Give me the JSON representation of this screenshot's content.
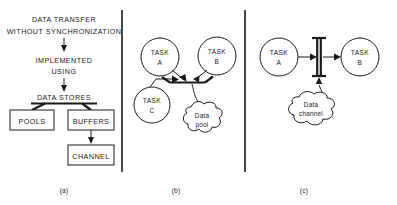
{
  "figure": {
    "width": 397,
    "height": 205,
    "background": "#ffffff",
    "ink_color": "#1a1a1a"
  },
  "panels": [
    {
      "id": "a",
      "label": "(a)",
      "caption_x": 64,
      "caption_y": 193,
      "kind": "flow-hierarchy"
    },
    {
      "id": "b",
      "label": "(b)",
      "caption_x": 176,
      "caption_y": 193,
      "kind": "pool-diagram"
    },
    {
      "id": "c",
      "label": "(c)",
      "caption_x": 304,
      "caption_y": 193,
      "kind": "channel-diagram"
    }
  ],
  "panel_a": {
    "heading_line1": "DATA TRANSFER",
    "heading_line2": "WITHOUT SYNCHRONIZATION",
    "connector_line1": "IMPLEMENTED",
    "connector_line2": "USING",
    "category": "DATA STORES",
    "boxes": [
      {
        "label": "POOLS",
        "x": 10,
        "y": 110,
        "w": 44,
        "h": 20
      },
      {
        "label": "BUFFERS",
        "x": 68,
        "y": 110,
        "w": 46,
        "h": 20
      },
      {
        "label": "CHANNEL",
        "x": 68,
        "y": 145,
        "w": 46,
        "h": 20
      }
    ]
  },
  "panel_b": {
    "tasks": [
      {
        "label_line1": "TASK",
        "label_line2": "A",
        "cx": 160,
        "cy": 57,
        "r": 19
      },
      {
        "label_line1": "TASK",
        "label_line2": "B",
        "cx": 217,
        "cy": 56,
        "r": 19
      },
      {
        "label_line1": "TASK",
        "label_line2": "C",
        "cx": 152,
        "cy": 105,
        "r": 18
      }
    ],
    "cloud": {
      "label_line1": "Data",
      "label_line2": "pool",
      "cx": 202,
      "cy": 122
    },
    "store_symbol": "pool-trough"
  },
  "panel_c": {
    "tasks": [
      {
        "label_line1": "TASK",
        "label_line2": "A",
        "cx": 279,
        "cy": 57,
        "r": 19
      },
      {
        "label_line1": "TASK",
        "label_line2": "B",
        "cx": 360,
        "cy": 57,
        "r": 19
      }
    ],
    "cloud": {
      "label_line1": "Data",
      "label_line2": "channel",
      "cx": 311,
      "cy": 111
    },
    "store_symbol": "channel-ibeam"
  }
}
